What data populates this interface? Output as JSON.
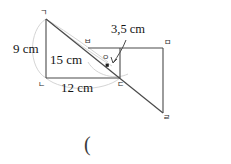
{
  "figure": {
    "kind": "geometry-diagram",
    "stroke_color": "#4a4a4a",
    "guide_color": "#c8c8c8",
    "background": "#ffffff",
    "vertices": [
      {
        "name": "vertex-g",
        "label": "ㄱ",
        "x": 46,
        "y": 19,
        "label_x": 40,
        "label_y": 9
      },
      {
        "name": "vertex-n",
        "label": "ㄴ",
        "x": 46,
        "y": 78,
        "label_x": 38,
        "label_y": 81
      },
      {
        "name": "vertex-d",
        "label": "ㄷ",
        "x": 120,
        "y": 78,
        "label_x": 117,
        "label_y": 81
      },
      {
        "name": "vertex-m",
        "label": "ㅁ",
        "x": 163,
        "y": 48,
        "label_x": 164,
        "label_y": 39
      },
      {
        "name": "vertex-r",
        "label": "ㄹ",
        "x": 163,
        "y": 113,
        "label_x": 163,
        "label_y": 114
      },
      {
        "name": "vertex-b",
        "label": "ㅂ",
        "x": 88,
        "y": 48,
        "label_x": 84,
        "label_y": 38
      },
      {
        "name": "vertex-o",
        "label": "ㅇ",
        "x": 108,
        "y": 62,
        "label_x": 102,
        "label_y": 54
      }
    ],
    "measurements": [
      {
        "name": "height-label",
        "text": "9 cm",
        "x": 13,
        "y": 42
      },
      {
        "name": "hypotenuse-label",
        "text": "15 cm",
        "x": 50,
        "y": 53
      },
      {
        "name": "base-label",
        "text": "12 cm",
        "x": 61,
        "y": 81
      },
      {
        "name": "segment-label",
        "text": "3,5 cm",
        "x": 111,
        "y": 23
      }
    ],
    "answer_prompt": {
      "text": "(",
      "x": 84,
      "y": 134
    }
  }
}
